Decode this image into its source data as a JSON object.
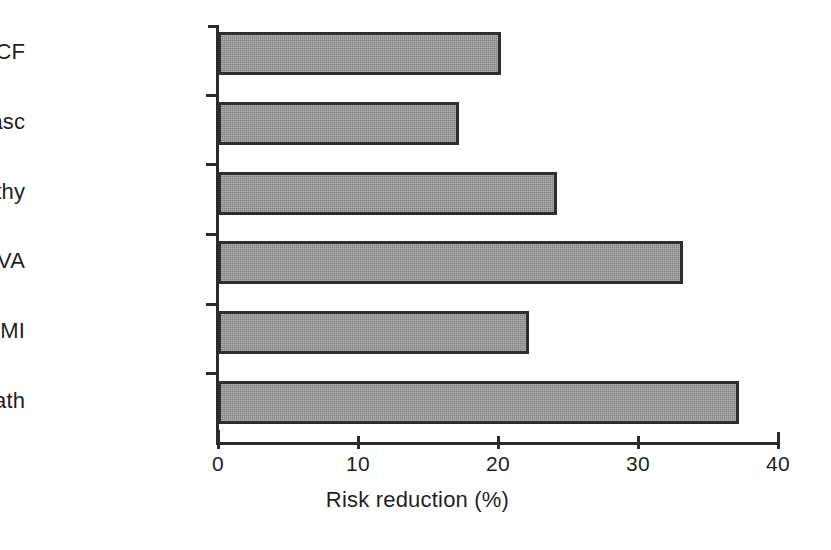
{
  "chart_data": {
    "type": "bar",
    "orientation": "horizontal",
    "title": "",
    "subtitle": "",
    "xlabel": "Risk reduction (%)",
    "ylabel": "",
    "categories": [
      "CV death",
      "Non-fatal MI",
      "CVA",
      "Nephropathy",
      "Revasc",
      "CCF"
    ],
    "values": [
      37,
      22,
      33,
      24,
      17,
      20
    ],
    "series": [
      {
        "name": "Risk reduction",
        "values": [
          37,
          22,
          33,
          24,
          17,
          20
        ]
      }
    ],
    "xlim": [
      0,
      40
    ],
    "xticks": [
      0,
      10,
      20,
      30,
      40
    ],
    "xtick_labels": [
      "0",
      "10",
      "20",
      "30",
      "40"
    ],
    "grid": false,
    "legend": false,
    "legend_position": "none",
    "annotations": [],
    "bar_fill_color": "#949494",
    "bar_edge_color": "#2e2e2e",
    "axis_color": "#2b2b2b",
    "background_color": "#ffffff"
  },
  "axis": {
    "x_title": "Risk reduction (%)"
  }
}
